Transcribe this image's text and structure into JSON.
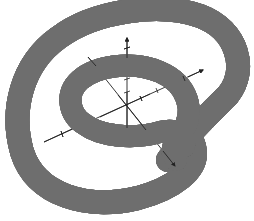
{
  "figure": {
    "background": "#ffffff",
    "tube": {
      "base_color": "#8a8a8a",
      "highlight_color": "#f4f4f4",
      "shadow_color": "#5a5a5a"
    },
    "axes": {
      "color": "#222222",
      "labels": [
        "x",
        "y",
        "z"
      ],
      "show_labels": false
    }
  }
}
